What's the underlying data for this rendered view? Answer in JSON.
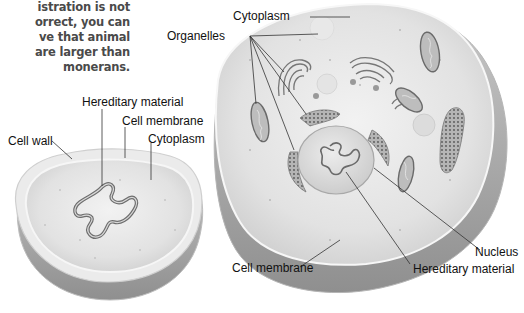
{
  "caption": {
    "lines": [
      "istration is not",
      "orrect, you can",
      "ve that animal",
      "are larger than",
      "monerans."
    ]
  },
  "moneran_cell": {
    "labels": {
      "hereditary_material": "Hereditary material",
      "cell_membrane": "Cell membrane",
      "cytoplasm": "Cytoplasm",
      "cell_wall": "Cell wall"
    }
  },
  "animal_cell": {
    "labels": {
      "cytoplasm": "Cytoplasm",
      "organelles": "Organelles",
      "nucleus": "Nucleus",
      "hereditary_material": "Hereditary material",
      "cell_membrane": "Cell membrane"
    }
  },
  "colors": {
    "cell_fill": "#e6e6e6",
    "cell_shadow": "#9a9a9a",
    "organelle": "#8a8a8a",
    "leader_line": "#333333",
    "caption_text": "#4a4a4a"
  }
}
